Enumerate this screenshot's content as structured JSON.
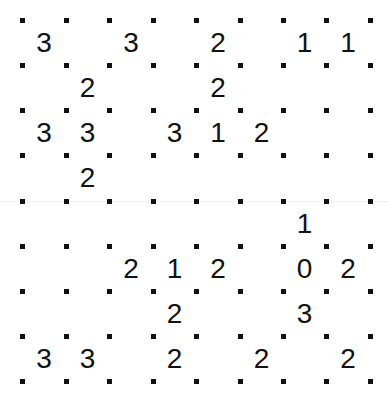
{
  "puzzle": {
    "type": "slitherlink",
    "rows": 8,
    "cols": 8,
    "dot_x": [
      22,
      66,
      109,
      153,
      196,
      240,
      283,
      326,
      370
    ],
    "dot_y": [
      20,
      65,
      110,
      155,
      201,
      246,
      291,
      336,
      381
    ],
    "clues": [
      [
        3,
        null,
        3,
        null,
        2,
        null,
        1,
        1
      ],
      [
        null,
        2,
        null,
        null,
        2,
        null,
        null,
        null
      ],
      [
        3,
        3,
        null,
        3,
        1,
        2,
        null,
        null
      ],
      [
        null,
        2,
        null,
        null,
        null,
        null,
        null,
        null
      ],
      [
        null,
        null,
        null,
        null,
        null,
        null,
        1,
        null
      ],
      [
        null,
        null,
        2,
        1,
        2,
        null,
        0,
        2
      ],
      [
        null,
        null,
        null,
        2,
        null,
        null,
        3,
        null
      ],
      [
        3,
        3,
        null,
        2,
        null,
        2,
        null,
        2
      ]
    ]
  }
}
